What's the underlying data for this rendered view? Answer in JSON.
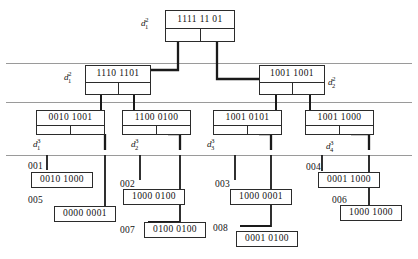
{
  "diagram": {
    "colors": {
      "ink": "#2b2b2b",
      "guide": "#9a9a9a",
      "pointer": "#1a1a1a",
      "background": "#ffffff"
    },
    "levels": [
      {
        "name": "level-2-root",
        "guide_y": 63
      },
      {
        "name": "level-2",
        "guide_y": 102
      },
      {
        "name": "level-3",
        "guide_y": 155
      }
    ],
    "root": {
      "id": "d-1-2-root",
      "label": "d",
      "sub": "1",
      "sup": "2",
      "key": "1111 11 01"
    },
    "internal": [
      {
        "id": "d-1-2",
        "label": "d",
        "sub": "1",
        "sup": "2",
        "key": "1110 1101",
        "label_side": "left"
      },
      {
        "id": "d-2-2",
        "label": "d",
        "sub": "2",
        "sup": "2",
        "key": "1001 1001",
        "label_side": "right"
      }
    ],
    "third": [
      {
        "id": "d-1-3",
        "label": "d",
        "sub": "1",
        "sup": "3",
        "key": "0010 1001"
      },
      {
        "id": "d-2-3",
        "label": "d",
        "sub": "2",
        "sup": "3",
        "key": "1100 0100"
      },
      {
        "id": "d-3-3",
        "label": "d",
        "sub": "3",
        "sup": "3",
        "key": "1001 0101"
      },
      {
        "id": "d-4-3",
        "label": "d",
        "sub": "4",
        "sup": "3",
        "key": "1001 1000"
      }
    ],
    "leaves": [
      {
        "id": "leaf-001",
        "tag": "001",
        "value": "0010 1000"
      },
      {
        "id": "leaf-005",
        "tag": "005",
        "value": "0000 0001"
      },
      {
        "id": "leaf-002",
        "tag": "002",
        "value": "1000 0100"
      },
      {
        "id": "leaf-007",
        "tag": "007",
        "value": "0100 0100"
      },
      {
        "id": "leaf-003",
        "tag": "003",
        "value": "1000 0001"
      },
      {
        "id": "leaf-008",
        "tag": "008",
        "value": "0001 0100"
      },
      {
        "id": "leaf-004",
        "tag": "004",
        "value": "0001 1000"
      },
      {
        "id": "leaf-006",
        "tag": "006",
        "value": "1000 1000"
      }
    ]
  }
}
